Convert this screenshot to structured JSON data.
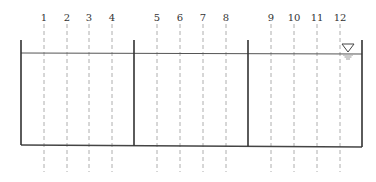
{
  "diagram": {
    "type": "tank-cross-section",
    "section_labels": [
      "1",
      "2",
      "3",
      "4",
      "5",
      "6",
      "7",
      "8",
      "9",
      "10",
      "11",
      "12"
    ],
    "section_x": [
      44,
      67,
      89,
      112,
      157,
      180,
      203,
      226,
      271,
      294,
      317,
      340
    ],
    "walls_x": [
      21,
      134,
      248,
      362
    ],
    "water_level_y": 53,
    "wall_top_y": 40,
    "floor_left_y": 145,
    "floor_right_y": 147,
    "dash_top_y": 24,
    "dash_bottom_y": 172,
    "water_symbol": {
      "name": "water-level-triangle",
      "x": 348,
      "y": 44
    },
    "colors": {
      "wall": "#333333",
      "dash": "#9a9a9a",
      "water_ripple": "#aaaaaa"
    }
  }
}
